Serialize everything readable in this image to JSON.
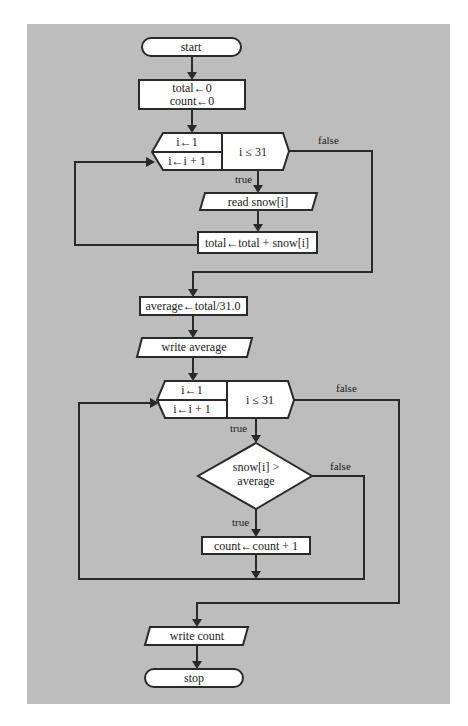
{
  "diagram": {
    "type": "flowchart",
    "colors": {
      "background": "#bdbdbd",
      "shape_fill": "#ffffff",
      "stroke": "#2a2a2a"
    },
    "nodes": {
      "start": {
        "kind": "terminator",
        "label": "start"
      },
      "init": {
        "kind": "process",
        "lines": [
          "total←0",
          "count←0"
        ]
      },
      "loop1": {
        "kind": "loop-hexagon",
        "init": "i←1",
        "update": "i←i + 1",
        "condition": "i ≤ 31"
      },
      "read": {
        "kind": "io",
        "label": "read snow[i]"
      },
      "accumulate": {
        "kind": "process",
        "label": "total←total + snow[i]"
      },
      "average": {
        "kind": "process",
        "label": "average←total/31.0"
      },
      "write_average": {
        "kind": "io",
        "label": "write average"
      },
      "loop2": {
        "kind": "loop-hexagon",
        "init": "i←1",
        "update": "i←i + 1",
        "condition": "i ≤ 31"
      },
      "decision": {
        "kind": "decision",
        "lines": [
          "snow[i] >",
          "average"
        ]
      },
      "increment": {
        "kind": "process",
        "label": "count←count + 1"
      },
      "write_count": {
        "kind": "io",
        "label": "write count"
      },
      "stop": {
        "kind": "terminator",
        "label": "stop"
      }
    },
    "edge_labels": {
      "loop1_true": "true",
      "loop1_false": "false",
      "loop2_true": "true",
      "loop2_false": "false",
      "decision_true": "true",
      "decision_false": "false"
    }
  }
}
